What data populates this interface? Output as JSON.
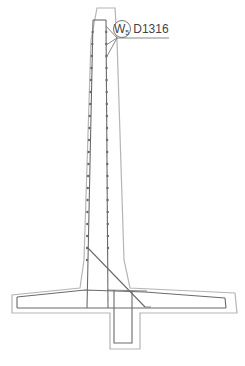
{
  "drawing": {
    "title": "Retaining wall reinforcement section",
    "callout": {
      "mark": "W",
      "mark_subscript": "5",
      "bar_size": "D1316"
    },
    "colors": {
      "concrete_outline": "#b5b5b5",
      "rebar": "#6a6a6a",
      "background": "#ffffff"
    }
  }
}
